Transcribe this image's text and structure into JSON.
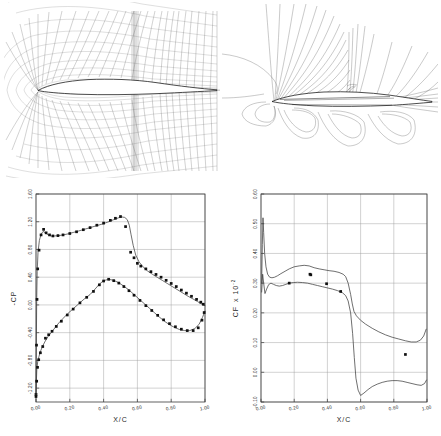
{
  "figure": {
    "panels": [
      {
        "id": "grid",
        "kind": "computational-grid",
        "description": "C-type structured mesh around airfoil"
      },
      {
        "id": "mach",
        "kind": "contour-plot",
        "description": "Mach number contours around airfoil with shock"
      },
      {
        "id": "cp",
        "kind": "line-scatter-plot"
      },
      {
        "id": "cf",
        "kind": "line-scatter-plot"
      }
    ]
  },
  "chart_data": [
    {
      "type": "line",
      "id": "cp-plot",
      "title": "",
      "xlabel": "X/C",
      "ylabel": "-CP",
      "xlim": [
        0.0,
        1.0
      ],
      "ylim": [
        -1.4,
        1.6
      ],
      "xticks": [
        "0.00",
        "0.20",
        "0.40",
        "0.60",
        "0.80",
        "1.00"
      ],
      "xtick_values": [
        0.0,
        0.2,
        0.4,
        0.6,
        0.8,
        1.0
      ],
      "yticks": [
        "1.60",
        "1.20",
        "0.80",
        "0.40",
        "0.00",
        "-0.40",
        "-0.80",
        "-1.20"
      ],
      "ytick_values": [
        1.6,
        1.2,
        0.8,
        0.4,
        0.0,
        -0.4,
        -0.8,
        -1.2
      ],
      "grid": true,
      "legend": "none",
      "series": [
        {
          "name": "upper surface computed",
          "style": "line",
          "x": [
            0.0,
            0.002,
            0.004,
            0.007,
            0.012,
            0.02,
            0.03,
            0.042,
            0.056,
            0.072,
            0.09,
            0.11,
            0.135,
            0.16,
            0.19,
            0.22,
            0.25,
            0.285,
            0.32,
            0.355,
            0.39,
            0.425,
            0.46,
            0.49,
            0.51,
            0.525,
            0.54,
            0.552,
            0.562,
            0.575,
            0.59,
            0.61,
            0.635,
            0.66,
            0.69,
            0.72,
            0.75,
            0.78,
            0.81,
            0.84,
            0.87,
            0.9,
            0.93,
            0.955,
            0.975,
            0.99,
            1.0
          ],
          "y": [
            -1.3,
            -0.6,
            0.05,
            0.48,
            0.76,
            0.93,
            1.02,
            1.06,
            1.04,
            1.01,
            0.995,
            0.995,
            1.0,
            1.01,
            1.025,
            1.045,
            1.065,
            1.09,
            1.115,
            1.14,
            1.165,
            1.195,
            1.23,
            1.258,
            1.268,
            1.262,
            1.23,
            1.15,
            1.02,
            0.86,
            0.72,
            0.62,
            0.545,
            0.49,
            0.44,
            0.395,
            0.35,
            0.305,
            0.26,
            0.215,
            0.17,
            0.125,
            0.085,
            0.05,
            0.02,
            0.0,
            -0.01
          ]
        },
        {
          "name": "upper surface experiment",
          "style": "markers",
          "x": [
            0.0,
            0.003,
            0.006,
            0.01,
            0.018,
            0.03,
            0.045,
            0.06,
            0.08,
            0.1,
            0.13,
            0.16,
            0.2,
            0.24,
            0.28,
            0.32,
            0.36,
            0.4,
            0.44,
            0.47,
            0.5,
            0.53,
            0.56,
            0.58,
            0.6,
            0.62,
            0.65,
            0.68,
            0.71,
            0.74,
            0.77,
            0.8,
            0.83,
            0.86,
            0.89,
            0.92,
            0.95,
            0.975,
            0.99
          ],
          "y": [
            -1.29,
            -0.58,
            0.08,
            0.52,
            0.79,
            1.01,
            1.09,
            1.04,
            1.01,
            0.995,
            1.0,
            1.01,
            1.03,
            1.055,
            1.085,
            1.115,
            1.15,
            1.18,
            1.22,
            1.25,
            1.275,
            1.13,
            0.76,
            0.68,
            0.6,
            0.56,
            0.52,
            0.48,
            0.44,
            0.4,
            0.355,
            0.31,
            0.265,
            0.215,
            0.17,
            0.125,
            0.08,
            0.04,
            0.01
          ]
        },
        {
          "name": "lower surface computed",
          "style": "line",
          "x": [
            0.0,
            0.002,
            0.005,
            0.01,
            0.018,
            0.028,
            0.04,
            0.055,
            0.072,
            0.09,
            0.112,
            0.135,
            0.16,
            0.19,
            0.22,
            0.25,
            0.285,
            0.32,
            0.35,
            0.375,
            0.4,
            0.43,
            0.46,
            0.49,
            0.52,
            0.55,
            0.58,
            0.61,
            0.64,
            0.67,
            0.7,
            0.73,
            0.76,
            0.79,
            0.82,
            0.85,
            0.88,
            0.91,
            0.94,
            0.965,
            0.985,
            1.0
          ],
          "y": [
            -1.33,
            -1.12,
            -0.93,
            -0.82,
            -0.74,
            -0.66,
            -0.59,
            -0.52,
            -0.455,
            -0.4,
            -0.33,
            -0.26,
            -0.195,
            -0.12,
            -0.055,
            0.01,
            0.085,
            0.15,
            0.23,
            0.3,
            0.35,
            0.37,
            0.355,
            0.32,
            0.27,
            0.215,
            0.15,
            0.085,
            0.02,
            -0.045,
            -0.11,
            -0.175,
            -0.235,
            -0.285,
            -0.325,
            -0.355,
            -0.37,
            -0.37,
            -0.34,
            -0.28,
            -0.18,
            -0.09
          ]
        },
        {
          "name": "lower surface experiment",
          "style": "markers",
          "x": [
            0.0,
            0.004,
            0.009,
            0.016,
            0.026,
            0.04,
            0.056,
            0.075,
            0.095,
            0.12,
            0.15,
            0.185,
            0.22,
            0.26,
            0.3,
            0.34,
            0.375,
            0.4,
            0.43,
            0.46,
            0.49,
            0.52,
            0.55,
            0.58,
            0.615,
            0.65,
            0.685,
            0.72,
            0.755,
            0.79,
            0.825,
            0.86,
            0.895,
            0.93,
            0.96,
            0.982,
            0.995
          ],
          "y": [
            -1.32,
            -1.1,
            -0.9,
            -0.79,
            -0.69,
            -0.6,
            -0.48,
            -0.43,
            -0.38,
            -0.31,
            -0.235,
            -0.145,
            -0.06,
            0.03,
            0.11,
            0.195,
            0.29,
            0.345,
            0.37,
            0.35,
            0.315,
            0.265,
            0.205,
            0.14,
            0.065,
            -0.01,
            -0.08,
            -0.15,
            -0.215,
            -0.27,
            -0.315,
            -0.35,
            -0.37,
            -0.37,
            -0.33,
            -0.22,
            -0.11
          ]
        }
      ]
    },
    {
      "type": "line",
      "id": "cf-plot",
      "title": "",
      "xlabel": "X/C",
      "ylabel": "CF",
      "ylabel_scale": "x 10",
      "ylabel_exponent": "-2",
      "xlim": [
        0.0,
        1.0
      ],
      "ylim": [
        -0.1,
        0.6
      ],
      "xticks": [
        "0.00",
        "0.20",
        "0.40",
        "0.60",
        "0.80",
        "1.00"
      ],
      "xtick_values": [
        0.0,
        0.2,
        0.4,
        0.6,
        0.8,
        1.0
      ],
      "yticks": [
        "0.60",
        "0.50",
        "0.40",
        "0.30",
        "0.20",
        "0.10",
        "0.00",
        "-0.10"
      ],
      "ytick_values": [
        0.6,
        0.5,
        0.4,
        0.3,
        0.2,
        0.1,
        0.0,
        -0.1
      ],
      "grid": true,
      "legend": "none",
      "series": [
        {
          "name": "upper surface computed",
          "style": "line",
          "x": [
            0.004,
            0.008,
            0.012,
            0.016,
            0.022,
            0.03,
            0.04,
            0.052,
            0.066,
            0.082,
            0.1,
            0.12,
            0.145,
            0.17,
            0.2,
            0.23,
            0.26,
            0.29,
            0.32,
            0.35,
            0.38,
            0.41,
            0.44,
            0.47,
            0.495,
            0.51,
            0.525,
            0.54,
            0.55,
            0.56,
            0.575,
            0.6,
            0.63,
            0.67,
            0.71,
            0.75,
            0.79,
            0.83,
            0.87,
            0.905,
            0.935,
            0.96,
            0.98,
            0.995
          ],
          "y": [
            0.3,
            0.43,
            0.52,
            0.47,
            0.4,
            0.355,
            0.33,
            0.32,
            0.318,
            0.32,
            0.325,
            0.332,
            0.34,
            0.348,
            0.355,
            0.358,
            0.36,
            0.358,
            0.352,
            0.348,
            0.345,
            0.342,
            0.34,
            0.336,
            0.33,
            0.322,
            0.3,
            0.262,
            0.23,
            0.205,
            0.19,
            0.175,
            0.162,
            0.148,
            0.136,
            0.126,
            0.118,
            0.112,
            0.106,
            0.102,
            0.102,
            0.108,
            0.122,
            0.145
          ]
        },
        {
          "name": "lower surface computed",
          "style": "line",
          "x": [
            0.004,
            0.01,
            0.016,
            0.024,
            0.034,
            0.046,
            0.06,
            0.075,
            0.092,
            0.11,
            0.13,
            0.15,
            0.17,
            0.195,
            0.22,
            0.25,
            0.28,
            0.31,
            0.34,
            0.37,
            0.4,
            0.43,
            0.46,
            0.49,
            0.51,
            0.525,
            0.54,
            0.552,
            0.562,
            0.572,
            0.585,
            0.6,
            0.62,
            0.645,
            0.67,
            0.7,
            0.73,
            0.76,
            0.79,
            0.82,
            0.85,
            0.88,
            0.91,
            0.94,
            0.965,
            0.985,
            0.997
          ],
          "y": [
            0.27,
            0.33,
            0.3,
            0.265,
            0.28,
            0.295,
            0.3,
            0.296,
            0.292,
            0.29,
            0.292,
            0.296,
            0.3,
            0.302,
            0.303,
            0.302,
            0.3,
            0.296,
            0.292,
            0.288,
            0.284,
            0.28,
            0.275,
            0.268,
            0.258,
            0.24,
            0.2,
            0.13,
            0.05,
            -0.02,
            -0.06,
            -0.078,
            -0.07,
            -0.058,
            -0.048,
            -0.04,
            -0.034,
            -0.03,
            -0.028,
            -0.028,
            -0.03,
            -0.034,
            -0.038,
            -0.042,
            -0.044,
            -0.038,
            -0.026
          ]
        },
        {
          "name": "experiment",
          "style": "markers",
          "x": [
            0.17,
            0.295,
            0.3,
            0.395,
            0.48,
            0.87
          ],
          "y": [
            0.3,
            0.33,
            0.328,
            0.298,
            0.272,
            0.06
          ]
        }
      ]
    }
  ]
}
